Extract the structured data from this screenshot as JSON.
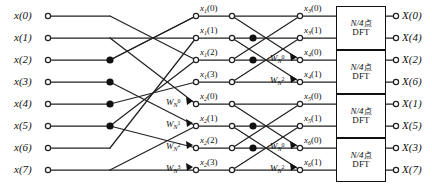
{
  "diagram": {
    "stroke_color": "#222222",
    "node_fill_open": "#ffffff",
    "node_fill_solid": "#111111"
  },
  "inputs": [
    {
      "name": "x",
      "index": "0",
      "label": "x(0)"
    },
    {
      "name": "x",
      "index": "1",
      "label": "x(1)"
    },
    {
      "name": "x",
      "index": "2",
      "label": "x(2)"
    },
    {
      "name": "x",
      "index": "3",
      "label": "x(3)"
    },
    {
      "name": "x",
      "index": "4",
      "label": "x(4)"
    },
    {
      "name": "x",
      "index": "5",
      "label": "x(5)"
    },
    {
      "name": "x",
      "index": "6",
      "label": "x(6)"
    },
    {
      "name": "x",
      "index": "7",
      "label": "x(7)"
    }
  ],
  "stage1_labels": [
    {
      "base": "x",
      "sub": "1",
      "arg": "(0)"
    },
    {
      "base": "x",
      "sub": "1",
      "arg": "(1)"
    },
    {
      "base": "x",
      "sub": "1",
      "arg": "(2)"
    },
    {
      "base": "x",
      "sub": "1",
      "arg": "(3)"
    },
    {
      "base": "x",
      "sub": "2",
      "arg": "(0)"
    },
    {
      "base": "x",
      "sub": "2",
      "arg": "(1)"
    },
    {
      "base": "x",
      "sub": "2",
      "arg": "(2)"
    },
    {
      "base": "x",
      "sub": "2",
      "arg": "(3)"
    }
  ],
  "stage2_labels": [
    {
      "base": "x",
      "sub": "3",
      "arg": "(0)"
    },
    {
      "base": "x",
      "sub": "3",
      "arg": "(1)"
    },
    {
      "base": "x",
      "sub": "4",
      "arg": "(0)"
    },
    {
      "base": "x",
      "sub": "4",
      "arg": "(1)"
    },
    {
      "base": "x",
      "sub": "5",
      "arg": "(0)"
    },
    {
      "base": "x",
      "sub": "5",
      "arg": "(1)"
    },
    {
      "base": "x",
      "sub": "6",
      "arg": "(0)"
    },
    {
      "base": "x",
      "sub": "6",
      "arg": "(1)"
    }
  ],
  "twiddles_stage1": [
    {
      "base": "W",
      "sub": "N",
      "sup": "0"
    },
    {
      "base": "W",
      "sub": "N",
      "sup": "1"
    },
    {
      "base": "W",
      "sub": "N",
      "sup": "2"
    },
    {
      "base": "W",
      "sub": "N",
      "sup": "3"
    }
  ],
  "twiddles_stage2": [
    {
      "base": "W",
      "sub": "N",
      "sup": "0"
    },
    {
      "base": "W",
      "sub": "N",
      "sup": "2"
    },
    {
      "base": "W",
      "sub": "N",
      "sup": "0"
    },
    {
      "base": "W",
      "sub": "N",
      "sup": "2"
    }
  ],
  "dft_blocks": [
    {
      "line1_math": "N/4",
      "line1_cjk": "点",
      "line2": "DFT"
    },
    {
      "line1_math": "N/4",
      "line1_cjk": "点",
      "line2": "DFT"
    },
    {
      "line1_math": "N/4",
      "line1_cjk": "点",
      "line2": "DFT"
    },
    {
      "line1_math": "N/4",
      "line1_cjk": "点",
      "line2": "DFT"
    }
  ],
  "outputs": [
    {
      "name": "X",
      "index": "0",
      "label": "X(0)"
    },
    {
      "name": "X",
      "index": "4",
      "label": "X(4)"
    },
    {
      "name": "X",
      "index": "2",
      "label": "X(2)"
    },
    {
      "name": "X",
      "index": "6",
      "label": "X(6)"
    },
    {
      "name": "X",
      "index": "1",
      "label": "X(1)"
    },
    {
      "name": "X",
      "index": "5",
      "label": "X(5)"
    },
    {
      "name": "X",
      "index": "3",
      "label": "X(3)"
    },
    {
      "name": "X",
      "index": "7",
      "label": "X(7)"
    }
  ]
}
